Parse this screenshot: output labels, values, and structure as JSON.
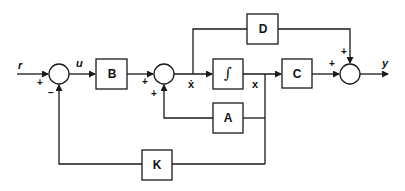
{
  "diagram": {
    "type": "block-diagram",
    "blocks": {
      "B": "B",
      "integrator": "∫",
      "C": "C",
      "D": "D",
      "A": "A",
      "K": "K"
    },
    "signals": {
      "r": "r",
      "u": "u",
      "xdot": "ẋ",
      "x": "x",
      "y": "y"
    },
    "signs": {
      "sum1_input": "+",
      "sum1_feedback": "−",
      "sum2_input": "+",
      "sum2_feedback": "+",
      "sum3_input": "+",
      "sum3_feedforward": "+"
    },
    "colors": {
      "line": "#1a1a1a",
      "background": "#ffffff"
    }
  }
}
